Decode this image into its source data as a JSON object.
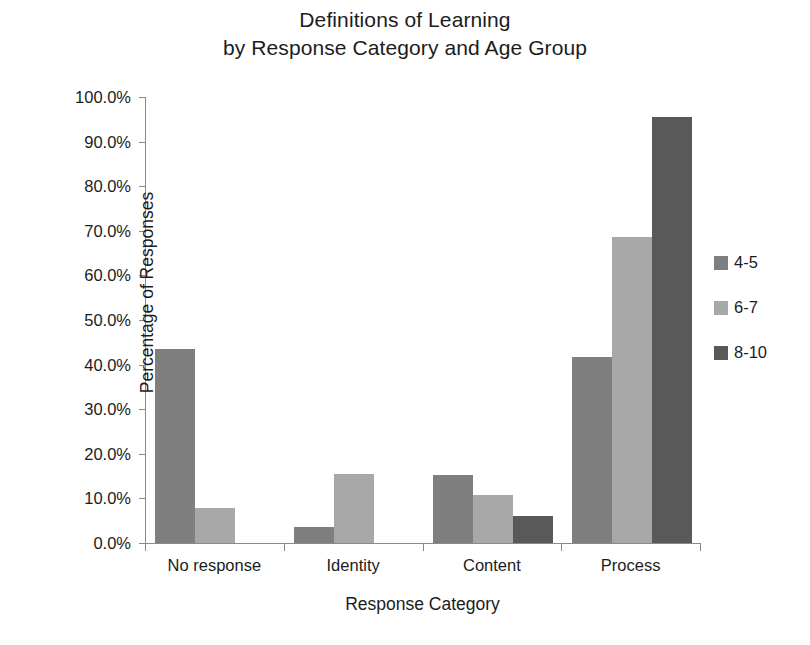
{
  "chart_data": {
    "type": "bar",
    "title": "Definitions of Learning by Response Category and Age Group",
    "title_lines": [
      "Definitions of Learning",
      "by Response Category and Age Group"
    ],
    "xlabel": "Response Category",
    "ylabel": "Percentage of Responses",
    "categories": [
      "No response",
      "Identity",
      "Content",
      "Process"
    ],
    "series": [
      {
        "name": "4-5",
        "color": "#7f7f7f",
        "values": [
          43.5,
          3.5,
          15.2,
          41.8
        ]
      },
      {
        "name": "6-7",
        "color": "#a8a8a8",
        "values": [
          7.8,
          15.5,
          10.8,
          68.6
        ]
      },
      {
        "name": "8-10",
        "color": "#595959",
        "values": [
          0.0,
          0.0,
          6.1,
          95.5
        ]
      }
    ],
    "ylim": [
      0,
      100
    ],
    "y_tick_values": [
      0,
      10,
      20,
      30,
      40,
      50,
      60,
      70,
      80,
      90,
      100
    ],
    "y_tick_labels": [
      "0.0%",
      "10.0%",
      "20.0%",
      "30.0%",
      "40.0%",
      "50.0%",
      "60.0%",
      "70.0%",
      "80.0%",
      "90.0%",
      "100.0%"
    ],
    "grid": false,
    "legend_position": "right",
    "legend_entries": [
      "4-5",
      "6-7",
      "8-10"
    ]
  }
}
